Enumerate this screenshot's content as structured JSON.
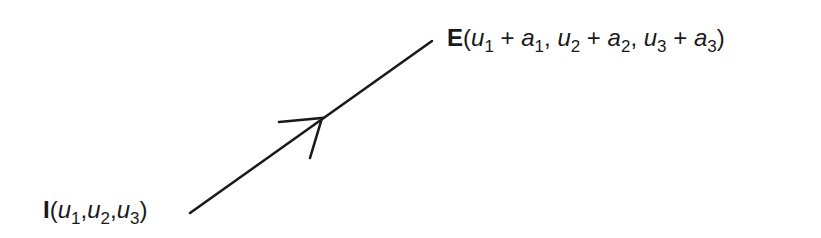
{
  "diagram": {
    "type": "directed-line-segment",
    "start_point": {
      "name": "I",
      "coords": [
        {
          "var": "u",
          "sub": "1"
        },
        {
          "var": "u",
          "sub": "2"
        },
        {
          "var": "u",
          "sub": "3"
        }
      ],
      "label_text": "I(u1,u2,u3)"
    },
    "end_point": {
      "name": "E",
      "coords": [
        {
          "var": "u",
          "sub": "1",
          "plus_var": "a",
          "plus_sub": "1"
        },
        {
          "var": "u",
          "sub": "2",
          "plus_var": "a",
          "plus_sub": "2"
        },
        {
          "var": "u",
          "sub": "3",
          "plus_var": "a",
          "plus_sub": "3"
        }
      ],
      "label_text": "E(u1 + a1, u2 + a2, u3 + a3)"
    },
    "line": {
      "x1": 190,
      "y1": 213,
      "x2": 432,
      "y2": 41,
      "stroke": "#1a1a1a",
      "width": 2.6
    },
    "arrowhead": {
      "tip": [
        322,
        118
      ],
      "barb_left": [
        279,
        122
      ],
      "barb_down": [
        310,
        158
      ]
    },
    "symbols": {
      "open_paren": "(",
      "close_paren": ")",
      "comma": ",",
      "plus": " + ",
      "sep": ", "
    }
  }
}
